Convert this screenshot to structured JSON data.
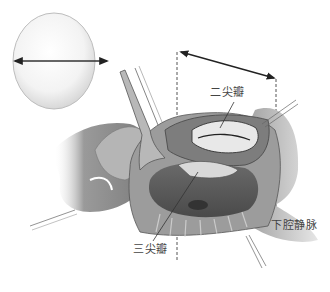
{
  "figure": {
    "type": "surgical-illustration",
    "style": "grayscale pencil shading",
    "labels": {
      "mitral_valve": "二尖瓣",
      "tricuspid_valve": "三尖瓣",
      "inferior_vena_cava": "下腔静脉"
    },
    "elements": {
      "sizer_disc": "circular valve sizer with double-headed diameter arrow",
      "measurement_arrow": "double-headed arrow spanning dashed guide lines above the heart",
      "retractor": "hand-held retractor lifting atrial wall",
      "stay_sutures": "traction sutures at incision corners"
    },
    "colors": {
      "background": "#ffffff",
      "line": "#333333",
      "shade_dark": "#555555",
      "shade_mid": "#8a8a8a",
      "shade_light": "#cfcfcf",
      "label_text": "#444444"
    }
  }
}
